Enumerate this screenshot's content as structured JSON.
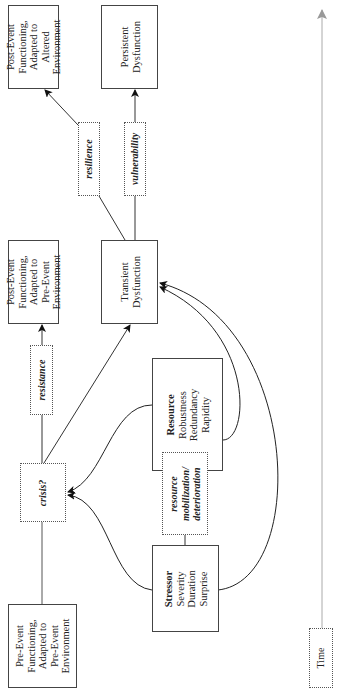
{
  "diagram": {
    "orientation": "rotated-90-ccw",
    "boxes": {
      "pre_event": {
        "lines": [
          "Pre-Event",
          "Functioning,",
          "Adapted to",
          "Pre-Event",
          "Environment"
        ]
      },
      "post_event_pre": {
        "lines": [
          "Post-Event",
          "Functioning,",
          "Adapted to",
          "Pre-Event",
          "Environment"
        ]
      },
      "post_event_altered": {
        "lines": [
          "Post-Event",
          "Functioning,",
          "Adapted to",
          "Altered",
          "Environment"
        ]
      },
      "transient_dysfunction": {
        "lines": [
          "Transient",
          "Dysfunction"
        ]
      },
      "persistent_dysfunction": {
        "lines": [
          "Persistent",
          "Dysfunction"
        ]
      },
      "stressor": {
        "title": "Stressor",
        "lines": [
          "Severity",
          "Duration",
          "Surprise"
        ]
      },
      "resource": {
        "title": "Resource",
        "lines": [
          "Robustness",
          "Redundancy",
          "Rapidity"
        ]
      }
    },
    "processes": {
      "crisis": "crisis?",
      "resistance": "resistance",
      "resilience": "resilience",
      "vulnerability": "vulnerability",
      "resource_mobilization": [
        "resource",
        "mobilization/",
        "deterioration"
      ]
    },
    "axis": {
      "label": "Time"
    },
    "colors": {
      "line": "#222222",
      "box_border": "#444444",
      "axis": "#aaaaaa",
      "background": "#ffffff"
    }
  }
}
